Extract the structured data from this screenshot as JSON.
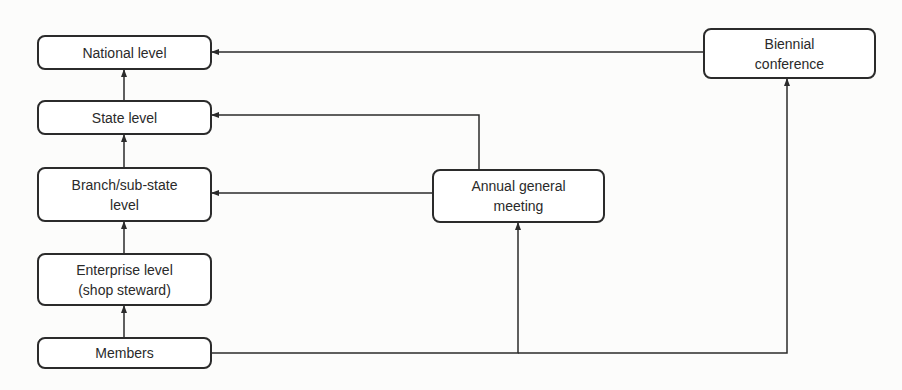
{
  "diagram": {
    "type": "flowchart",
    "colors": {
      "background": "#fcfcfb",
      "stroke": "#2b2b2b",
      "text": "#2a2a2a"
    },
    "nodes": {
      "national": {
        "label": "National level"
      },
      "state": {
        "label": "State level"
      },
      "branch": {
        "label": "Branch/sub-state\nlevel"
      },
      "enterprise": {
        "label": "Enterprise level\n(shop steward)"
      },
      "members": {
        "label": "Members"
      },
      "agm": {
        "label": "Annual general\nmeeting"
      },
      "biennial": {
        "label": "Biennial\nconference"
      }
    },
    "edges": [
      {
        "from": "members",
        "to": "enterprise"
      },
      {
        "from": "enterprise",
        "to": "branch"
      },
      {
        "from": "branch",
        "to": "state"
      },
      {
        "from": "state",
        "to": "national"
      },
      {
        "from": "members",
        "to": "agm"
      },
      {
        "from": "members",
        "to": "biennial"
      },
      {
        "from": "agm",
        "to": "branch"
      },
      {
        "from": "agm",
        "to": "state"
      },
      {
        "from": "biennial",
        "to": "national"
      }
    ]
  }
}
